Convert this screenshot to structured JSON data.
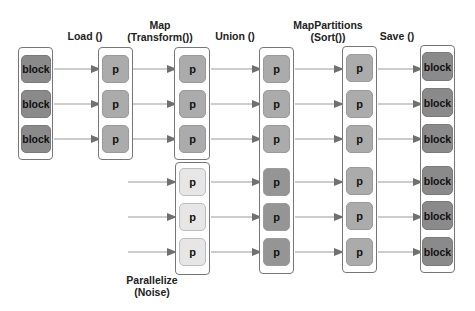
{
  "stages": [
    {
      "id": "source",
      "label": "",
      "sub": ""
    },
    {
      "id": "load",
      "label": "Load ()",
      "sub": ""
    },
    {
      "id": "map",
      "label": "Map",
      "sub": "(Transform())"
    },
    {
      "id": "union",
      "label": "Union ()",
      "sub": ""
    },
    {
      "id": "mappartitions",
      "label": "MapPartitions",
      "sub": "(Sort())"
    },
    {
      "id": "save",
      "label": "Save ()",
      "sub": ""
    }
  ],
  "parallelize": {
    "label": "Parallelize",
    "sub": "(Noise)"
  },
  "nodes": {
    "block": "block",
    "partition": "p"
  },
  "colors": {
    "block": "#8a8a8a",
    "partition": "#ababab",
    "noise_partition": "#e6e6e6",
    "arrow": "#707070",
    "container_border": "#777777"
  }
}
